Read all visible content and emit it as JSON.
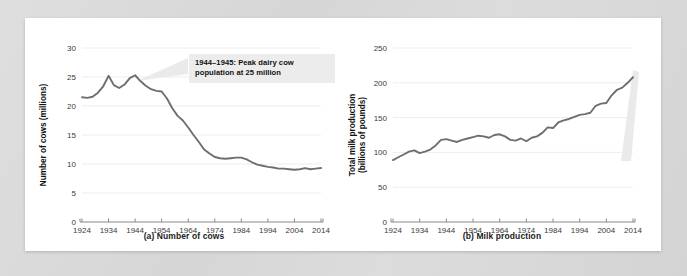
{
  "figure": {
    "background_color": "#d9d9d9",
    "card_color": "#ffffff",
    "line_color": "#6e6e6e",
    "callout_bg": "#ececec",
    "grid_color": "#ededed",
    "axis_color": "#8a8a8a"
  },
  "panel_a": {
    "caption": "(a) Number of cows",
    "callout": "1944–1945: Peak dairy cow\npopulation at 25 million"
  },
  "panel_b": {
    "caption": "(b) Milk production",
    "callout": "2014: U.S. farmers produce 2.3\ntimes as much milk as in 1920"
  },
  "chart_data": [
    {
      "type": "line",
      "title": "(a) Number of cows",
      "xlabel": "",
      "ylabel": "Number of cows (millions)",
      "xlim": [
        1924,
        2014
      ],
      "ylim": [
        0,
        30
      ],
      "grid": true,
      "legend": "none",
      "xticks": [
        1924,
        1934,
        1944,
        1954,
        1964,
        1974,
        1984,
        1994,
        2004,
        2014
      ],
      "yticks": [
        0,
        5,
        10,
        15,
        20,
        25,
        30
      ],
      "xtick_labels": [
        "1924",
        "1934",
        "1944",
        "1954",
        "1964",
        "1974",
        "1984",
        "1994",
        "2004",
        "2014"
      ],
      "ytick_labels": [
        "0",
        "5",
        "10",
        "15",
        "20",
        "25",
        "30"
      ],
      "annotations": [
        {
          "text": "1944–1945: Peak dairy cow population at 25 million",
          "points_to_x": 1944,
          "points_to_y": 25.3
        }
      ],
      "x": [
        1924,
        1926,
        1928,
        1930,
        1932,
        1934,
        1936,
        1938,
        1940,
        1942,
        1944,
        1946,
        1948,
        1950,
        1952,
        1954,
        1956,
        1958,
        1960,
        1962,
        1964,
        1966,
        1968,
        1970,
        1972,
        1974,
        1976,
        1978,
        1980,
        1982,
        1984,
        1986,
        1988,
        1990,
        1992,
        1994,
        1996,
        1998,
        2000,
        2002,
        2004,
        2006,
        2008,
        2010,
        2012,
        2014
      ],
      "y": [
        21.5,
        21.4,
        21.6,
        22.3,
        23.4,
        25.2,
        23.6,
        23.1,
        23.7,
        24.8,
        25.3,
        24.3,
        23.5,
        22.9,
        22.6,
        22.5,
        21.3,
        19.6,
        18.3,
        17.5,
        16.3,
        15.0,
        13.8,
        12.5,
        11.8,
        11.2,
        11.0,
        10.9,
        11.0,
        11.1,
        11.1,
        10.8,
        10.3,
        9.9,
        9.7,
        9.5,
        9.4,
        9.2,
        9.2,
        9.1,
        9.0,
        9.1,
        9.3,
        9.1,
        9.2,
        9.3
      ]
    },
    {
      "type": "line",
      "title": "(b) Milk production",
      "xlabel": "",
      "ylabel": "Total milk production (billions of pounds)",
      "ylabel_line1": "Total milk production",
      "ylabel_line2": "(billions of pounds)",
      "xlim": [
        1924,
        2014
      ],
      "ylim": [
        0,
        250
      ],
      "grid": true,
      "legend": "none",
      "xticks": [
        1924,
        1934,
        1944,
        1954,
        1964,
        1974,
        1984,
        1994,
        2004,
        2014
      ],
      "yticks": [
        0,
        50,
        100,
        150,
        200,
        250
      ],
      "xtick_labels": [
        "1924",
        "1934",
        "1944",
        "1954",
        "1964",
        "1974",
        "1984",
        "1994",
        "2004",
        "2014"
      ],
      "ytick_labels": [
        "0",
        "50",
        "100",
        "150",
        "200",
        "250"
      ],
      "annotations": [
        {
          "text": "2014: U.S. farmers produce 2.3 times as much milk as in 1920",
          "points_to_x": 2014,
          "points_to_y": 208
        }
      ],
      "x": [
        1924,
        1926,
        1928,
        1930,
        1932,
        1934,
        1936,
        1938,
        1940,
        1942,
        1944,
        1946,
        1948,
        1950,
        1952,
        1954,
        1956,
        1958,
        1960,
        1962,
        1964,
        1966,
        1968,
        1970,
        1972,
        1974,
        1976,
        1978,
        1980,
        1982,
        1984,
        1986,
        1988,
        1990,
        1992,
        1994,
        1996,
        1998,
        2000,
        2002,
        2004,
        2006,
        2008,
        2010,
        2012,
        2014
      ],
      "y": [
        89,
        93,
        97,
        101,
        103,
        99,
        101,
        104,
        110,
        118,
        119,
        117,
        115,
        118,
        120,
        122,
        124,
        123,
        121,
        125,
        126,
        123,
        118,
        117,
        120,
        116,
        121,
        123,
        128,
        136,
        135,
        143,
        146,
        148,
        151,
        154,
        155,
        157,
        167,
        170,
        171,
        182,
        190,
        193,
        200,
        208
      ]
    }
  ]
}
